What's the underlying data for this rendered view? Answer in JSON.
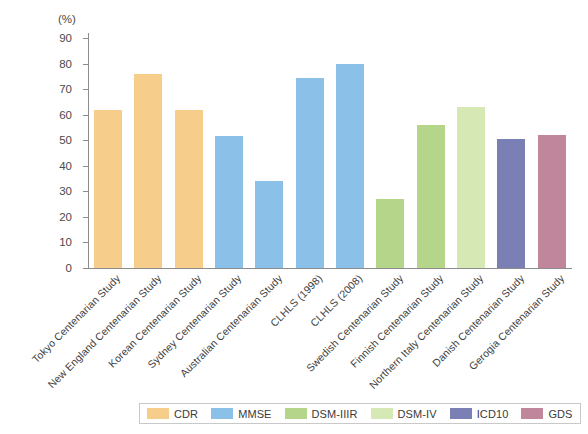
{
  "chart_data": {
    "type": "bar",
    "title": "",
    "xlabel": "",
    "ylabel": "(%)",
    "ylim": [
      0,
      90
    ],
    "ytick_step": 10,
    "yticks": [
      "90",
      "80",
      "70",
      "60",
      "50",
      "40",
      "30",
      "20",
      "10",
      "0"
    ],
    "grid": false,
    "legend_position": "bottom",
    "categories": [
      "Tokyo Centenarian Study",
      "New England Centenarian Study",
      "Korean Centenarian Study",
      "Sydney Centenarian Study",
      "Australian Centenarian Study",
      "CLHLS (1998)",
      "CLHLS (2008)",
      "Swedish Centenarian Study",
      "Finnish Centenarian Study",
      "Northern Italy Centenarian Study",
      "Danish Centenarian Study",
      "Gerogia Centenarian Study"
    ],
    "values": [
      62,
      76,
      62,
      51.5,
      34,
      74.5,
      80,
      27,
      56,
      63,
      50.5,
      52
    ],
    "point_groups": [
      "CDR",
      "CDR",
      "CDR",
      "MMSE",
      "MMSE",
      "MMSE",
      "MMSE",
      "DSM-IIIR",
      "DSM-IIIR",
      "DSM-IV",
      "ICD10",
      "GDS"
    ],
    "series": [
      {
        "name": "CDR",
        "color": "#f7cd8c"
      },
      {
        "name": "MMSE",
        "color": "#8bc0e8"
      },
      {
        "name": "DSM-IIIR",
        "color": "#b5d58b"
      },
      {
        "name": "DSM-IV",
        "color": "#d6e8b4"
      },
      {
        "name": "ICD10",
        "color": "#7a80b4"
      },
      {
        "name": "GDS",
        "color": "#c0879c"
      }
    ]
  },
  "legend": {
    "items": [
      {
        "label": "CDR",
        "color": "#f7cd8c"
      },
      {
        "label": "MMSE",
        "color": "#8bc0e8"
      },
      {
        "label": "DSM-IIIR",
        "color": "#b5d58b"
      },
      {
        "label": "DSM-IV",
        "color": "#d6e8b4"
      },
      {
        "label": "ICD10",
        "color": "#7a80b4"
      },
      {
        "label": "GDS",
        "color": "#c0879c"
      }
    ]
  }
}
